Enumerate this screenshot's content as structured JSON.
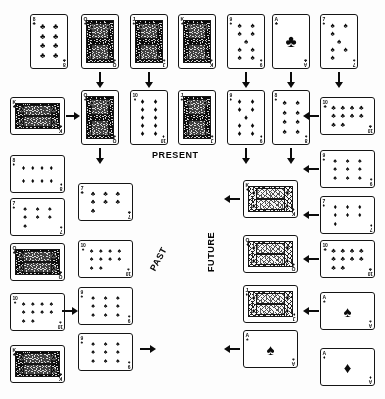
{
  "figure": {
    "background_color": "#fdfdfd",
    "ink_color": "#111111"
  },
  "labels": [
    {
      "name": "present-label",
      "text": "PRESENT",
      "x": 152,
      "y": 150,
      "rotation": 0
    },
    {
      "name": "past-label",
      "text": "PAST",
      "x": 148,
      "y": 268,
      "rotation": -62
    },
    {
      "name": "future-label",
      "text": "FUTURE",
      "x": 206,
      "y": 272,
      "rotation": -90
    }
  ],
  "cards": [
    {
      "id": "c1",
      "rank": "8",
      "suit": "clubs",
      "suit_glyph": "♣",
      "orientation": "vertical",
      "face": "number",
      "x": 30,
      "y": 14
    },
    {
      "id": "c2",
      "rank": "Q",
      "suit": "spades",
      "suit_glyph": "♠",
      "orientation": "vertical",
      "face": "court",
      "x": 81,
      "y": 14
    },
    {
      "id": "c3",
      "rank": "J",
      "suit": "spades",
      "suit_glyph": "♠",
      "orientation": "vertical",
      "face": "court",
      "x": 130,
      "y": 14
    },
    {
      "id": "c4",
      "rank": "K",
      "suit": "spades",
      "suit_glyph": "♠",
      "orientation": "vertical",
      "face": "court",
      "x": 178,
      "y": 14
    },
    {
      "id": "c5",
      "rank": "9",
      "suit": "spades",
      "suit_glyph": "♠",
      "orientation": "vertical",
      "face": "number",
      "x": 227,
      "y": 14
    },
    {
      "id": "c6",
      "rank": "A",
      "suit": "clubs",
      "suit_glyph": "♣",
      "orientation": "vertical",
      "face": "number",
      "x": 272,
      "y": 14
    },
    {
      "id": "c7",
      "rank": "7",
      "suit": "spades",
      "suit_glyph": "♠",
      "orientation": "vertical",
      "face": "number",
      "x": 320,
      "y": 14
    },
    {
      "id": "c8",
      "rank": "K",
      "suit": "clubs",
      "suit_glyph": "♣",
      "orientation": "horizontal",
      "face": "court",
      "x": 10,
      "y": 97
    },
    {
      "id": "c9",
      "rank": "Q",
      "suit": "spades",
      "suit_glyph": "♠",
      "orientation": "vertical",
      "face": "court",
      "x": 81,
      "y": 90
    },
    {
      "id": "c10",
      "rank": "10",
      "suit": "diamonds",
      "suit_glyph": "♦",
      "orientation": "vertical",
      "face": "number",
      "x": 130,
      "y": 90
    },
    {
      "id": "c11",
      "rank": "J",
      "suit": "spades",
      "suit_glyph": "♠",
      "orientation": "vertical",
      "face": "court",
      "x": 178,
      "y": 90
    },
    {
      "id": "c12",
      "rank": "9",
      "suit": "diamonds",
      "suit_glyph": "♦",
      "orientation": "vertical",
      "face": "number",
      "x": 227,
      "y": 90
    },
    {
      "id": "c13",
      "rank": "8",
      "suit": "spades",
      "suit_glyph": "♠",
      "orientation": "vertical",
      "face": "number",
      "x": 272,
      "y": 90
    },
    {
      "id": "c14",
      "rank": "10",
      "suit": "clubs",
      "suit_glyph": "♣",
      "orientation": "horizontal",
      "face": "number",
      "x": 320,
      "y": 97
    },
    {
      "id": "c15",
      "rank": "8",
      "suit": "diamonds",
      "suit_glyph": "♦",
      "orientation": "horizontal",
      "face": "number",
      "x": 10,
      "y": 155
    },
    {
      "id": "c16",
      "rank": "7",
      "suit": "clubs",
      "suit_glyph": "♣",
      "orientation": "horizontal",
      "face": "number",
      "x": 78,
      "y": 183
    },
    {
      "id": "c17",
      "rank": "9",
      "suit": "spades",
      "suit_glyph": "♠",
      "orientation": "horizontal",
      "face": "number",
      "x": 320,
      "y": 150
    },
    {
      "id": "c18",
      "rank": "7",
      "suit": "spades",
      "suit_glyph": "♠",
      "orientation": "horizontal",
      "face": "number",
      "x": 10,
      "y": 198
    },
    {
      "id": "c19",
      "rank": "K",
      "suit": "diamonds",
      "suit_glyph": "♦",
      "orientation": "horizontal",
      "face": "court",
      "x": 243,
      "y": 180
    },
    {
      "id": "c20",
      "rank": "7",
      "suit": "diamonds",
      "suit_glyph": "♦",
      "orientation": "horizontal",
      "face": "number",
      "x": 320,
      "y": 196
    },
    {
      "id": "c21",
      "rank": "Q",
      "suit": "clubs",
      "suit_glyph": "♣",
      "orientation": "horizontal",
      "face": "court",
      "x": 10,
      "y": 243
    },
    {
      "id": "c22",
      "rank": "10",
      "suit": "spades",
      "suit_glyph": "♠",
      "orientation": "horizontal",
      "face": "number",
      "x": 78,
      "y": 240
    },
    {
      "id": "c23",
      "rank": "Q",
      "suit": "diamonds",
      "suit_glyph": "♦",
      "orientation": "horizontal",
      "face": "court",
      "x": 243,
      "y": 235
    },
    {
      "id": "c24",
      "rank": "10",
      "suit": "clubs",
      "suit_glyph": "♣",
      "orientation": "horizontal",
      "face": "number",
      "x": 320,
      "y": 240
    },
    {
      "id": "c25",
      "rank": "10",
      "suit": "spades",
      "suit_glyph": "♠",
      "orientation": "horizontal",
      "face": "number",
      "x": 10,
      "y": 293
    },
    {
      "id": "c26",
      "rank": "9",
      "suit": "spades",
      "suit_glyph": "♠",
      "orientation": "horizontal",
      "face": "number",
      "x": 78,
      "y": 287
    },
    {
      "id": "c27",
      "rank": "J",
      "suit": "diamonds",
      "suit_glyph": "♦",
      "orientation": "horizontal",
      "face": "court",
      "x": 243,
      "y": 285
    },
    {
      "id": "c28",
      "rank": "A",
      "suit": "spades",
      "suit_glyph": "♠",
      "orientation": "horizontal",
      "face": "number",
      "x": 320,
      "y": 292
    },
    {
      "id": "c29",
      "rank": "K",
      "suit": "clubs",
      "suit_glyph": "♣",
      "orientation": "horizontal",
      "face": "court",
      "x": 10,
      "y": 345
    },
    {
      "id": "c30",
      "rank": "9",
      "suit": "spades",
      "suit_glyph": "♠",
      "orientation": "horizontal",
      "face": "number",
      "x": 78,
      "y": 333
    },
    {
      "id": "c31",
      "rank": "A",
      "suit": "spades",
      "suit_glyph": "♠",
      "orientation": "horizontal",
      "face": "number",
      "x": 243,
      "y": 330
    },
    {
      "id": "c32",
      "rank": "A",
      "suit": "diamonds",
      "suit_glyph": "♦",
      "orientation": "horizontal",
      "face": "number",
      "x": 320,
      "y": 348
    }
  ],
  "arrows": [
    {
      "name": "arrow-down-c2",
      "direction": "down",
      "x": 94,
      "y": 72,
      "w": 12,
      "h": 16
    },
    {
      "name": "arrow-down-c3",
      "direction": "down",
      "x": 143,
      "y": 72,
      "w": 12,
      "h": 16
    },
    {
      "name": "arrow-down-c5",
      "direction": "down",
      "x": 240,
      "y": 72,
      "w": 12,
      "h": 16
    },
    {
      "name": "arrow-down-c6",
      "direction": "down",
      "x": 285,
      "y": 72,
      "w": 12,
      "h": 16
    },
    {
      "name": "arrow-down-c7",
      "direction": "down",
      "x": 333,
      "y": 72,
      "w": 12,
      "h": 16
    },
    {
      "name": "arrow-right-c8",
      "direction": "right",
      "x": 66,
      "y": 110,
      "w": 14,
      "h": 12
    },
    {
      "name": "arrow-left-c14",
      "direction": "left",
      "x": 303,
      "y": 110,
      "w": 16,
      "h": 12
    },
    {
      "name": "arrow-down-c9",
      "direction": "down",
      "x": 94,
      "y": 148,
      "w": 12,
      "h": 16
    },
    {
      "name": "arrow-down-c12",
      "direction": "down",
      "x": 240,
      "y": 148,
      "w": 12,
      "h": 16
    },
    {
      "name": "arrow-down-c13",
      "direction": "down",
      "x": 285,
      "y": 148,
      "w": 12,
      "h": 16
    },
    {
      "name": "arrow-left-c17",
      "direction": "left",
      "x": 303,
      "y": 163,
      "w": 16,
      "h": 12
    },
    {
      "name": "arrow-left-c19",
      "direction": "left",
      "x": 224,
      "y": 193,
      "w": 16,
      "h": 12
    },
    {
      "name": "arrow-left-c20",
      "direction": "left",
      "x": 303,
      "y": 209,
      "w": 16,
      "h": 12
    },
    {
      "name": "arrow-left-c24",
      "direction": "left",
      "x": 303,
      "y": 253,
      "w": 16,
      "h": 12
    },
    {
      "name": "arrow-left-c28",
      "direction": "left",
      "x": 303,
      "y": 305,
      "w": 16,
      "h": 12
    },
    {
      "name": "arrow-left-c31",
      "direction": "left",
      "x": 224,
      "y": 343,
      "w": 16,
      "h": 12
    },
    {
      "name": "arrow-right-c18",
      "direction": "right",
      "x": 62,
      "y": 305,
      "w": 16,
      "h": 12
    },
    {
      "name": "arrow-right-end",
      "direction": "right",
      "x": 140,
      "y": 343,
      "w": 16,
      "h": 12
    }
  ]
}
